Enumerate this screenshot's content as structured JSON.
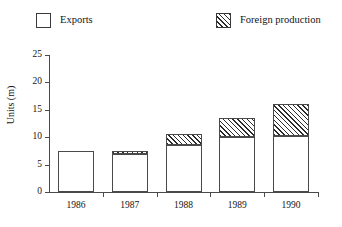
{
  "legend": {
    "position": "top",
    "entries": [
      {
        "label": "Exports",
        "swatch": "empty-square",
        "color": "#ffffff"
      },
      {
        "label": "Foreign production",
        "swatch": "hatched-square",
        "color": "#2b2b2b"
      }
    ]
  },
  "axes": {
    "y_label": "Units (m)",
    "y_ticks": [
      0,
      5,
      10,
      15,
      20,
      25
    ],
    "x_ticks": [
      "1986",
      "1987",
      "1988",
      "1989",
      "1990"
    ]
  },
  "chart_data": {
    "type": "bar",
    "subtype": "stacked",
    "title": "",
    "xlabel": "",
    "ylabel": "Units (m)",
    "categories": [
      "1986",
      "1987",
      "1988",
      "1989",
      "1990"
    ],
    "series": [
      {
        "name": "Exports",
        "values": [
          7.5,
          7.0,
          8.5,
          10.0,
          10.2
        ],
        "fill": "empty",
        "color": "#ffffff"
      },
      {
        "name": "Foreign production",
        "values": [
          0,
          0.5,
          2.0,
          3.5,
          5.8
        ],
        "fill": "diagonal-hatch",
        "color": "#2b2b2b"
      }
    ],
    "totals": [
      7.5,
      7.5,
      10.5,
      13.5,
      16.0
    ],
    "ylim": [
      0,
      25
    ],
    "ytick_step": 5,
    "grid": false,
    "legend_position": "top"
  }
}
